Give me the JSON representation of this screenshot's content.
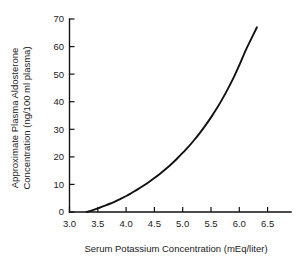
{
  "chart_data": {
    "type": "line",
    "title": "",
    "xlabel": "Serum Potassium Concentration (mEq/liter)",
    "ylabel_line1": "Approximate Plasma Aldosterone",
    "ylabel_line2": "Concentration (ng/100 ml plasma)",
    "ylabel": "Approximate Plasma Aldosterone Concentration (ng/100 ml plasma)",
    "xlim": [
      3.0,
      6.9
    ],
    "ylim": [
      0,
      70
    ],
    "grid": false,
    "legend": false,
    "xticks": [
      "3.0",
      "3.5",
      "4.0",
      "4.5",
      "5.0",
      "5.5",
      "6.0",
      "6.5"
    ],
    "xtick_values": [
      3.0,
      3.5,
      4.0,
      4.5,
      5.0,
      5.5,
      6.0,
      6.5
    ],
    "yticks": [
      "0",
      "10",
      "20",
      "30",
      "40",
      "50",
      "60",
      "70"
    ],
    "ytick_values": [
      0,
      10,
      20,
      30,
      40,
      50,
      60,
      70
    ],
    "line_color": "#111111",
    "axis_color": "#111111",
    "background_color": "#ffffff",
    "series": [
      {
        "name": "Plasma aldosterone vs serum potassium",
        "x": [
          3.3,
          3.4,
          3.5,
          3.6,
          3.7,
          3.8,
          3.9,
          4.0,
          4.1,
          4.2,
          4.3,
          4.4,
          4.5,
          4.6,
          4.7,
          4.8,
          4.9,
          5.0,
          5.1,
          5.2,
          5.3,
          5.4,
          5.5,
          5.6,
          5.7,
          5.8,
          5.9,
          6.0,
          6.1,
          6.2,
          6.3
        ],
        "y": [
          0.0,
          0.6,
          1.3,
          2.1,
          2.9,
          3.8,
          4.8,
          5.8,
          7.0,
          8.2,
          9.5,
          10.9,
          12.4,
          14.0,
          15.7,
          17.5,
          19.5,
          21.6,
          23.8,
          26.2,
          28.8,
          31.6,
          34.6,
          37.8,
          41.3,
          45.1,
          49.2,
          53.7,
          58.5,
          62.8,
          67.0
        ]
      }
    ]
  }
}
